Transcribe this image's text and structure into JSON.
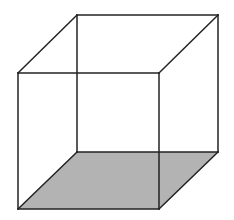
{
  "diagram": {
    "type": "wireframe-cube",
    "colors": {
      "background": "#ffffff",
      "edge": "#222222",
      "bottom_face_fill": "#b3b3b3"
    },
    "edge_width": 1.5,
    "vertices": {
      "front_top_left": [
        18,
        73
      ],
      "front_top_right": [
        159,
        73
      ],
      "front_bottom_left": [
        18,
        209
      ],
      "front_bottom_right": [
        159,
        209
      ],
      "back_top_left": [
        77,
        15
      ],
      "back_top_right": [
        218,
        15
      ],
      "back_bottom_left": [
        77,
        152
      ],
      "back_bottom_right": [
        218,
        152
      ]
    },
    "shaded_face": "bottom"
  }
}
